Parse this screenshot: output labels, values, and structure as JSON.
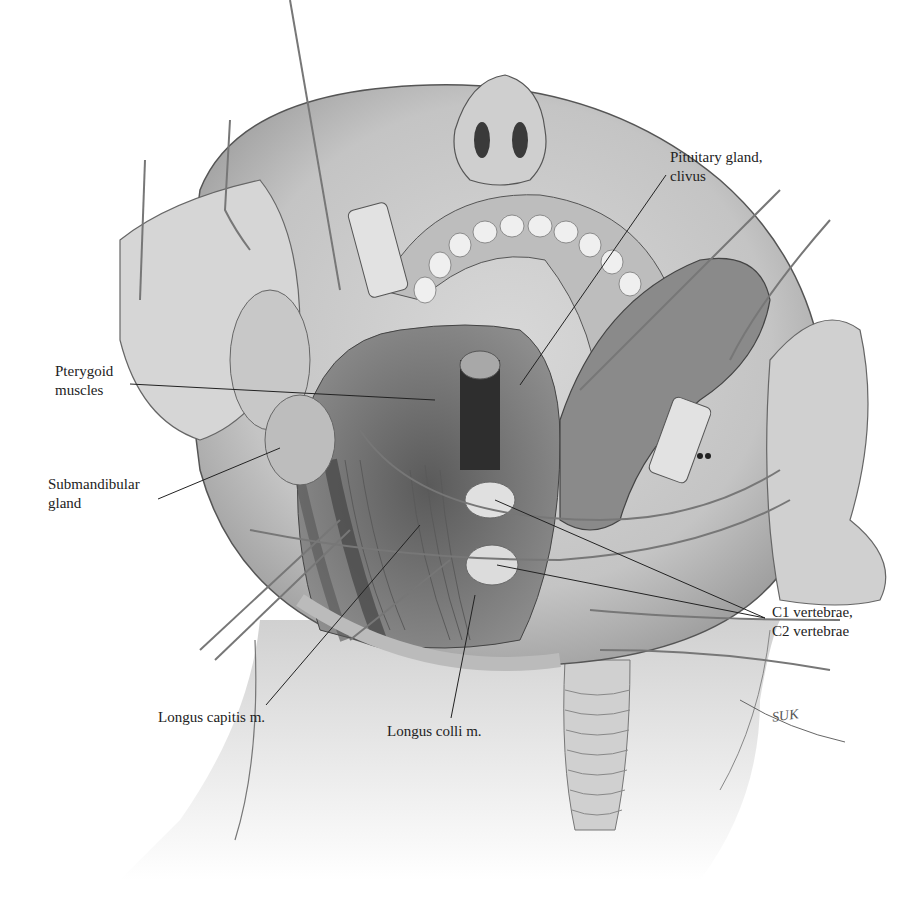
{
  "figure": {
    "signature": "SUK"
  },
  "labels": {
    "pituitary": {
      "line1": "Pituitary gland,",
      "line2": "clivus"
    },
    "pterygoid": {
      "line1": "Pterygoid",
      "line2": "muscles"
    },
    "submandibular": {
      "line1": "Submandibular",
      "line2": "gland"
    },
    "vertebrae": {
      "line1": "C1 vertebrae,",
      "line2": "C2 vertebrae"
    },
    "longus_capitis": {
      "line1": "Longus capitis m."
    },
    "longus_colli": {
      "line1": "Longus colli m."
    }
  },
  "colors": {
    "skin": "#e6e6e6",
    "shadow": "#9a9a9a",
    "dark": "#3a3a3a",
    "line": "#222222",
    "background": "#ffffff"
  }
}
